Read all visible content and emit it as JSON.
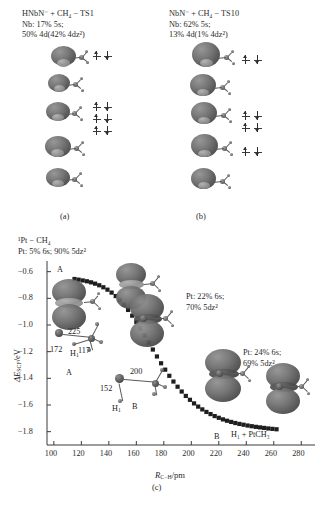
{
  "figure": {
    "panels": [
      {
        "id": "a",
        "caption": "(a)",
        "title_line1": "HNbN⁻ + CH₄ − TS1",
        "title_line2": "Nb:  17% 5s;",
        "title_line3": "50% 4d(42% 4dᴢ²)",
        "species": "HNbN-",
        "reactant": "CH4",
        "state": "TS1",
        "metal": "Nb",
        "s_percent": "17% 5s",
        "d_percent": "50% 4d",
        "dz2_percent": "42% 4dᴢ²"
      },
      {
        "id": "b",
        "caption": "(b)",
        "title_line1": "NbN⁻ + CH₄ − TS10",
        "title_line2": "Nb:  62% 5s;",
        "title_line3": "13% 4d(1% 4dᴢ²)",
        "species": "NbN-",
        "reactant": "CH4",
        "state": "TS10",
        "metal": "Nb",
        "s_percent": "62% 5s",
        "d_percent": "13% 4d",
        "dz2_percent": "1% 4dᴢ²"
      },
      {
        "id": "c",
        "caption": "(c)"
      }
    ]
  },
  "chart_data": {
    "type": "line",
    "title": "¹Pt − CH₄",
    "subtitle": "Pt:  5% 6s;  90% 5dᴢ²",
    "xlabel": "R",
    "xlabel_sub": "C−H",
    "xlabel_unit": "/pm",
    "xlabel_full": "R_C−H/pm",
    "ylabel": "ΔE",
    "ylabel_sub": "SCF",
    "ylabel_unit": "/eV",
    "ylabel_full": "ΔE_SCF/eV",
    "xlim": [
      95,
      290
    ],
    "ylim": [
      -1.9,
      -0.52
    ],
    "xticks": [
      100,
      120,
      140,
      160,
      180,
      200,
      220,
      240,
      260,
      280
    ],
    "yticks": [
      -0.6,
      -0.8,
      -1.0,
      -1.2,
      -1.4,
      -1.6,
      -1.8
    ],
    "ytick_labels": [
      "−0.6",
      "−0.8",
      "−1.0",
      "−1.2",
      "−1.4",
      "−1.6",
      "−1.8"
    ],
    "xtick_labels": [
      "100",
      "120",
      "140",
      "160",
      "180",
      "200",
      "220",
      "240",
      "260",
      "280"
    ],
    "grid": false,
    "legend": "none",
    "marker": "filled-square",
    "series": [
      {
        "name": "¹Pt + CH₄ reaction path",
        "x": [
          115,
          118,
          121,
          124,
          127,
          130,
          133,
          136,
          139,
          142,
          145,
          148,
          151,
          154,
          157,
          160,
          163,
          166,
          169,
          172,
          175,
          178,
          181,
          184,
          187,
          190,
          193,
          196,
          199,
          202,
          205,
          208,
          211,
          214,
          217,
          220,
          223,
          226,
          229,
          232,
          235,
          238,
          241,
          244,
          247,
          250,
          253,
          256,
          259,
          262
        ],
        "y": [
          -0.655,
          -0.66,
          -0.666,
          -0.672,
          -0.68,
          -0.69,
          -0.702,
          -0.717,
          -0.735,
          -0.757,
          -0.783,
          -0.813,
          -0.848,
          -0.887,
          -0.93,
          -0.977,
          -1.026,
          -1.078,
          -1.131,
          -1.184,
          -1.236,
          -1.287,
          -1.335,
          -1.381,
          -1.424,
          -1.463,
          -1.499,
          -1.532,
          -1.561,
          -1.588,
          -1.612,
          -1.633,
          -1.652,
          -1.668,
          -1.683,
          -1.696,
          -1.708,
          -1.718,
          -1.727,
          -1.735,
          -1.742,
          -1.748,
          -1.754,
          -1.759,
          -1.764,
          -1.768,
          -1.772,
          -1.776,
          -1.779,
          -1.782
        ]
      }
    ],
    "annotations": [
      {
        "id": "ann-mid",
        "text_line1": "Pt:  22% 6s;",
        "text_line2": "70% 5dᴢ²"
      },
      {
        "id": "ann-right",
        "text_line1": "Pt:  24% 6s;",
        "text_line2": "69% 5dᴢ²"
      }
    ],
    "point_labels": [
      {
        "id": "label-A-curve",
        "text": "A"
      },
      {
        "id": "label-225",
        "text": "225"
      },
      {
        "id": "label-172",
        "text": "172"
      },
      {
        "id": "label-H1-a",
        "text": "H",
        "sub": "1"
      },
      {
        "id": "label-117",
        "text": "117"
      },
      {
        "id": "label-A-struct",
        "text": "A"
      },
      {
        "id": "label-152",
        "text": "152"
      },
      {
        "id": "label-200",
        "text": "200"
      },
      {
        "id": "label-H1-b",
        "text": "H",
        "sub": "1"
      },
      {
        "id": "label-B-struct",
        "text": "B"
      },
      {
        "id": "label-B-curve",
        "text": "B"
      },
      {
        "id": "label-product",
        "text": "H₁ + PtCH₃"
      }
    ]
  },
  "colors": {
    "background": "#ffffff",
    "text": "#2b2b2b",
    "marker": "#1e1e1e",
    "axis": "#3a3a3a",
    "orbital_dark": "#4a4a4a",
    "orbital_light": "#9a9a9a"
  }
}
